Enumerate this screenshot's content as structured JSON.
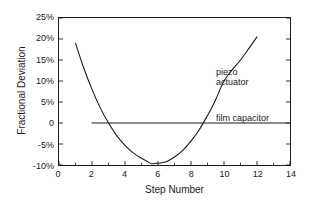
{
  "chart_data": {
    "type": "line",
    "title": "",
    "xlabel": "Step Number",
    "ylabel": "Fractional Deviation",
    "xlim": [
      0,
      14
    ],
    "ylim": [
      -10,
      25
    ],
    "grid": false,
    "legend_position": "inline-annotations",
    "x_ticks": [
      0,
      2,
      4,
      6,
      8,
      10,
      12,
      14
    ],
    "x_tick_labels": [
      "0",
      "2",
      "4",
      "6",
      "8",
      "10",
      "12",
      "14"
    ],
    "x_minor_ticks": [
      1,
      3,
      5,
      7,
      9,
      11,
      13
    ],
    "y_ticks": [
      -10,
      -5,
      0,
      5,
      10,
      15,
      20,
      25
    ],
    "y_tick_labels": [
      "-10%",
      "-5%",
      "0",
      "5%",
      "10%",
      "15%",
      "20%",
      "25%"
    ],
    "series": [
      {
        "name": "piezo actuator",
        "annotation": "piezo\nactuator",
        "color": "#1a1a1a",
        "x": [
          1.0,
          1.5,
          2.0,
          2.5,
          3.0,
          3.5,
          4.0,
          4.5,
          5.0,
          5.5,
          5.6,
          6.0,
          6.5,
          7.0,
          7.5,
          8.0,
          8.5,
          9.0,
          9.25,
          9.5,
          10.0,
          10.5,
          11.0,
          11.5,
          12.0
        ],
        "y": [
          19.0,
          13.1,
          8.0,
          3.6,
          0.0,
          -3.0,
          -5.3,
          -7.1,
          -8.4,
          -9.5,
          -9.7,
          -9.6,
          -9.2,
          -8.1,
          -6.5,
          -4.3,
          -1.6,
          1.8,
          3.6,
          5.6,
          10.0,
          12.7,
          15.0,
          17.7,
          20.5
        ]
      },
      {
        "name": "film capacitor",
        "annotation": "film capacitor",
        "color": "#1a1a1a",
        "x": [
          2.0,
          14.0
        ],
        "y": [
          0.0,
          0.0
        ]
      }
    ]
  },
  "figure": {
    "background_color": "#ffffff",
    "axis_color": "#1a1a1a",
    "text_color": "#1a1a1a"
  }
}
